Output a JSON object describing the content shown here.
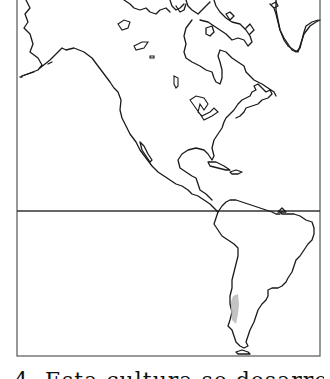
{
  "map": {
    "subject": "Outline map of the Americas (North, Central and South America)",
    "frame": {
      "left": 17,
      "top": 0,
      "right": 320,
      "bottom": 356
    },
    "equator_line_y": 211,
    "colors": {
      "outline": "#1a1a1a",
      "frame": "#555555",
      "background": "#ffffff",
      "highlight": "#b8b8b8"
    },
    "highlighted_region": {
      "label": "Central Chile (shaded strip along Pacific coast)",
      "color": "#b8b8b8"
    }
  },
  "caption": {
    "text": "4. Esta cultura se desarrolló en el"
  }
}
